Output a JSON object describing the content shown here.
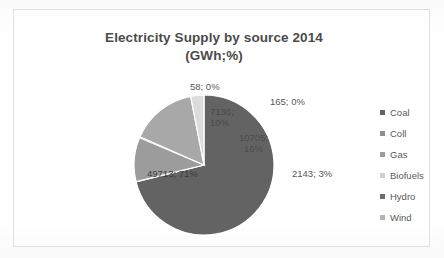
{
  "chart_data": {
    "type": "pie",
    "title_line1": "Electricity Supply by source 2014",
    "title_line2": "(GWh;%)",
    "title": "Electricity Supply by source 2014 (GWh;%)",
    "xlabel": "",
    "ylabel": "",
    "units": "GWh",
    "legend_position": "right",
    "grid": false,
    "total": 69920,
    "categories": [
      "Coal",
      "Coll",
      "Gas",
      "Biofuels",
      "Hydro",
      "Wind"
    ],
    "values": [
      49713,
      58,
      7136,
      165,
      10705,
      2143
    ],
    "percentages": [
      71,
      0,
      10,
      0,
      16,
      3
    ],
    "colors": [
      "#636363",
      "#8f8f8f",
      "#9c9c9c",
      "#cfcfcf",
      "#a8a8a8",
      "#dcdcdc"
    ],
    "data_labels": [
      {
        "category": "Coal",
        "text": "49713; 71%",
        "value": 49713,
        "percent": 71,
        "placement": "inside"
      },
      {
        "category": "Coll",
        "text": "58; 0%",
        "value": 58,
        "percent": 0,
        "placement": "outside"
      },
      {
        "category": "Gas",
        "text": "7136;",
        "text2": "10%",
        "value": 7136,
        "percent": 10,
        "placement": "inside"
      },
      {
        "category": "Biofuels",
        "text": "165; 0%",
        "value": 165,
        "percent": 0,
        "placement": "outside"
      },
      {
        "category": "Hydro",
        "text": "10705;",
        "text2": "16%",
        "value": 10705,
        "percent": 16,
        "placement": "inside"
      },
      {
        "category": "Wind",
        "text": "2143; 3%",
        "value": 2143,
        "percent": 3,
        "placement": "outside"
      }
    ],
    "legend": [
      {
        "label": "Coal",
        "color": "#636363"
      },
      {
        "label": "Coll",
        "color": "#8f8f8f"
      },
      {
        "label": "Gas",
        "color": "#9c9c9c"
      },
      {
        "label": "Biofuels",
        "color": "#cfcfcf"
      },
      {
        "label": "Hydro",
        "color": "#a8a8a8"
      },
      {
        "label": "Wind",
        "color": "#dcdcdc"
      }
    ]
  }
}
